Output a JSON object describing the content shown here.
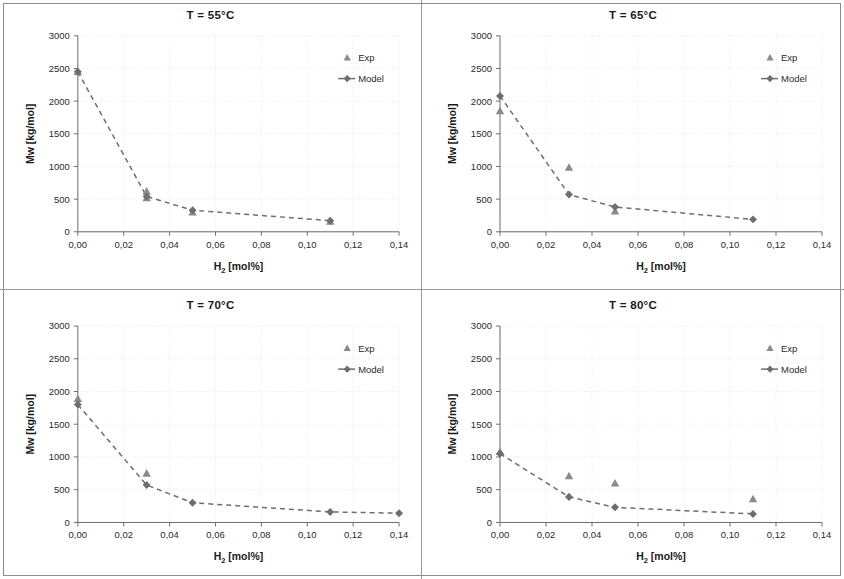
{
  "figure": {
    "axis_color": "#6f6f6f",
    "grid_color": "#e2e2e2",
    "series_color": "#7d7d7d",
    "exp_color": "#8a8a8a",
    "model_color": "#6e6e6e"
  },
  "axes": {
    "xlabel_main": "H",
    "xlabel_sub": "2",
    "xlabel_rest": " [mol%]",
    "ylabel": "Mw [kg/mol]",
    "xticks": [
      "0,00",
      "0,02",
      "0,04",
      "0,06",
      "0,08",
      "0,10",
      "0,12",
      "0,14"
    ],
    "yticks": [
      "0",
      "500",
      "1000",
      "1500",
      "2000",
      "2500",
      "3000"
    ],
    "xlim": [
      0,
      0.14
    ],
    "ylim": [
      0,
      3000
    ]
  },
  "legend": {
    "exp_label": "Exp",
    "model_label": "Model"
  },
  "chart_data": [
    {
      "type": "scatter",
      "title": "T = 55°C",
      "xlabel": "H2 [mol%]",
      "ylabel": "Mw [kg/mol]",
      "xlim": [
        0,
        0.14
      ],
      "ylim": [
        0,
        3000
      ],
      "grid": true,
      "legend_position": "top-right",
      "series": [
        {
          "name": "Exp",
          "x": [
            0.0,
            0.03,
            0.03,
            0.05,
            0.11
          ],
          "values": [
            2450,
            620,
            520,
            300,
            160
          ]
        },
        {
          "name": "Model",
          "x": [
            0.0,
            0.03,
            0.05,
            0.11
          ],
          "values": [
            2450,
            540,
            330,
            170
          ]
        }
      ]
    },
    {
      "type": "scatter",
      "title": "T = 65°C",
      "xlabel": "H2 [mol%]",
      "ylabel": "Mw [kg/mol]",
      "xlim": [
        0,
        0.14
      ],
      "ylim": [
        0,
        3000
      ],
      "grid": true,
      "legend_position": "top-right",
      "series": [
        {
          "name": "Exp",
          "x": [
            0.0,
            0.03,
            0.05
          ],
          "values": [
            1850,
            985,
            315
          ]
        },
        {
          "name": "Model",
          "x": [
            0.0,
            0.03,
            0.05,
            0.11
          ],
          "values": [
            2080,
            570,
            380,
            190
          ]
        }
      ]
    },
    {
      "type": "scatter",
      "title": "T = 70°C",
      "xlabel": "H2 [mol%]",
      "ylabel": "Mw [kg/mol]",
      "xlim": [
        0,
        0.14
      ],
      "ylim": [
        0,
        3000
      ],
      "grid": true,
      "legend_position": "top-right",
      "series": [
        {
          "name": "Exp",
          "x": [
            0.0,
            0.03
          ],
          "values": [
            1890,
            750
          ]
        },
        {
          "name": "Model",
          "x": [
            0.0,
            0.03,
            0.05,
            0.11,
            0.14
          ],
          "values": [
            1800,
            570,
            300,
            160,
            140
          ]
        }
      ]
    },
    {
      "type": "scatter",
      "title": "T = 80°C",
      "xlabel": "H2 [mol%]",
      "ylabel": "Mw [kg/mol]",
      "xlim": [
        0,
        0.14
      ],
      "ylim": [
        0,
        3000
      ],
      "grid": true,
      "legend_position": "top-right",
      "series": [
        {
          "name": "Exp",
          "x": [
            0.0,
            0.03,
            0.05,
            0.11
          ],
          "values": [
            1080,
            710,
            600,
            360
          ]
        },
        {
          "name": "Model",
          "x": [
            0.0,
            0.03,
            0.05,
            0.11
          ],
          "values": [
            1050,
            390,
            230,
            130
          ]
        }
      ]
    }
  ]
}
